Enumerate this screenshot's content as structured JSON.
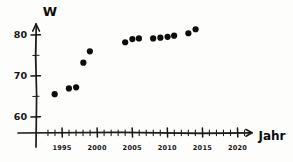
{
  "chart_data": {
    "type": "scatter",
    "title": "",
    "xlabel": "Jahr",
    "ylabel": "W",
    "xlim": [
      1992,
      2022
    ],
    "ylim": [
      57,
      83
    ],
    "grid": false,
    "legend": null,
    "x_tick_labels": [
      "1995",
      "2000",
      "2005",
      "2010",
      "2015",
      "2020"
    ],
    "x_ticks": [
      1995,
      2000,
      2005,
      2010,
      2015,
      2020
    ],
    "x_minor_tick_step": 1,
    "y_tick_labels": [
      "60",
      "70",
      "80"
    ],
    "y_ticks": [
      60,
      70,
      80
    ],
    "y_minor_tick_step": 5,
    "x": [
      1994,
      1996,
      1997,
      1998,
      1999,
      2004,
      2005,
      2006,
      2008,
      2009,
      2010,
      2011,
      2013,
      2014
    ],
    "y": [
      65.5,
      67.0,
      67.2,
      73.3,
      76.0,
      78.3,
      79.0,
      79.1,
      79.2,
      79.3,
      79.6,
      79.8,
      80.5,
      81.4
    ],
    "points": [
      {
        "x": 1994,
        "y": 65.5
      },
      {
        "x": 1996,
        "y": 67.0
      },
      {
        "x": 1997,
        "y": 67.2
      },
      {
        "x": 1998,
        "y": 73.3
      },
      {
        "x": 1999,
        "y": 76.0
      },
      {
        "x": 2004,
        "y": 78.3
      },
      {
        "x": 2005,
        "y": 79.0
      },
      {
        "x": 2006,
        "y": 79.1
      },
      {
        "x": 2008,
        "y": 79.2
      },
      {
        "x": 2009,
        "y": 79.3
      },
      {
        "x": 2010,
        "y": 79.6
      },
      {
        "x": 2011,
        "y": 79.8
      },
      {
        "x": 2013,
        "y": 80.5
      },
      {
        "x": 2014,
        "y": 81.4
      }
    ],
    "marker": "filled-circle",
    "marker_color": "#0d0d0d",
    "marker_size": 3.1,
    "style": "hand-drawn"
  },
  "axes": {
    "y_axis_name": "W",
    "x_axis_name": "Jahr"
  },
  "colors": {
    "ink": "#0d0d0d",
    "paper": "#fdfdfc"
  }
}
